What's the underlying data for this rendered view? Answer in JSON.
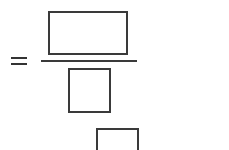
{
  "expression": {
    "operator": "=",
    "fraction": {
      "numerator": {
        "type": "blank-box",
        "value": ""
      },
      "denominator": {
        "type": "blank-box",
        "value": ""
      }
    },
    "extra_box": {
      "type": "blank-box",
      "value": ""
    }
  },
  "colors": {
    "stroke": "#3a3a3a",
    "background": "#ffffff"
  }
}
